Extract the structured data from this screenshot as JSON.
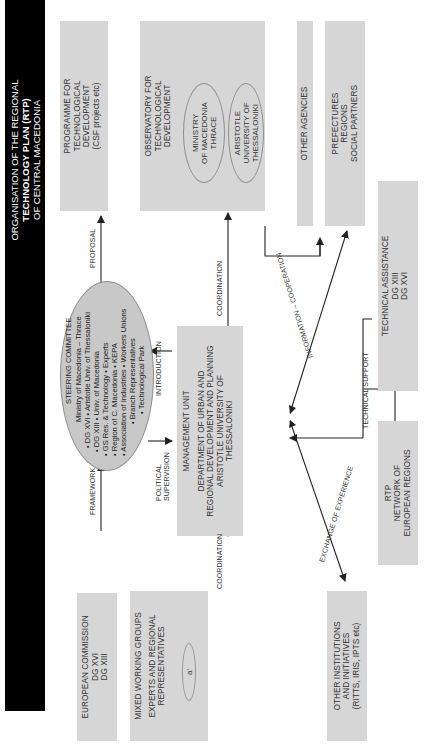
{
  "title": {
    "line1": "ORGANISATION OF THE REGIONAL",
    "line2": "TECHNOLOGY PLAN (RTP)",
    "line3": "OF CENTRAL MACEDONIA"
  },
  "colors": {
    "title_bg": "#000000",
    "box_fill": "#d6d6d6",
    "oval_fill": "#c8c8c8",
    "line": "#222222"
  },
  "boxes": {
    "programme": {
      "lines": [
        "PROGRAMME FOR",
        "TECHNOLOGICAL",
        "DEVELOPMENT",
        "(CSF projects etc)"
      ]
    },
    "observatory": {
      "lines": [
        "OBSERVATORY FOR",
        "TECHNOLOGICAL",
        "DEVELOPMENT"
      ],
      "ovals": [
        {
          "lines": [
            "MINISTRY",
            "OF MACEDONIA",
            "THRACE"
          ]
        },
        {
          "lines": [
            "ARISTOTLE",
            "UNIVERSITY OF",
            "THESSALONIKI"
          ]
        }
      ]
    },
    "other_agencies": {
      "label": "OTHER AGENCIES"
    },
    "prefectures": {
      "lines": [
        "PREFECTURES",
        "REGIONS",
        "SOCIAL PARTNERS"
      ]
    },
    "technical_assistance": {
      "lines": [
        "TECHNICAL ASSISTANCE",
        "DG XIII",
        "DG XVI"
      ]
    },
    "rtp_network": {
      "lines": [
        "RTP",
        "NETWORK OF",
        "EUROPEAN REGIONS"
      ]
    },
    "other_institutions": {
      "lines": [
        "OTHER INSTITUTIONS",
        "AND INITIATIVES",
        "(RITTS, IRIS, IPTS etc)"
      ]
    },
    "european_commission": {
      "lines": [
        "EUROPEAN COMMISSION",
        "DG XVI",
        "DG XIII"
      ]
    },
    "working_groups": {
      "title": "MIXED WORKING GROUPS",
      "subtitle_lines": [
        "EXPERTS AND REGIONAL",
        "REPRESENTATIVES"
      ],
      "groups": [
        "a'",
        "b'",
        "n'"
      ]
    },
    "management_unit": {
      "title": "MANAGEMENT UNIT",
      "lines": [
        "DEPARTMENT OF URBAN AND",
        "REGIONAL DEVELOPMENT AND PLANNING",
        "ARISTOTLE UNIVERSITY OF",
        "THESSALONIKI"
      ]
    }
  },
  "steering_committee": {
    "title": "STEERING COMMITTEE",
    "members": [
      "Ministry of Macedonia – Thrace",
      "• DG XVI  • Aristotle Univ. of Thessaloniki",
      "• DG XIII        • Univ. of Macedonia",
      "• GS Res. & Technology              • Experts",
      "• Region of C. Macedonia               • KEPA",
      "• Association of Industries  • Workers Unions",
      "• Branch Representatives",
      "• Technological Park"
    ]
  },
  "flows": {
    "proposal": "PROPOSAL",
    "coordination_top": "COORDINATION",
    "framework": "FRAMEWORK",
    "coordination_bottom": "COORDINATION",
    "introduction": "INTRODUCTION",
    "political_supervision_1": "POLITICAL",
    "political_supervision_2": "SUPERVISION",
    "information_cooperation": "INFORMATION – COOPERATION",
    "technical_support": "TECHNICAL SUPPORT",
    "exchange_of_experience": "EXCHANGE OF EXPERIENCE"
  }
}
